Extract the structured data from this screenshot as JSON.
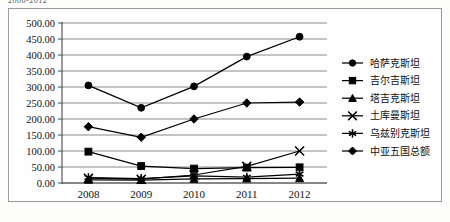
{
  "caption": {
    "text": "2008-2012"
  },
  "chart_data": {
    "type": "line",
    "title": "",
    "subtitle": "",
    "xlabel": "",
    "ylabel": "",
    "categories": [
      "2008",
      "2009",
      "2010",
      "2011",
      "2012"
    ],
    "x": [
      2008,
      2009,
      2010,
      2011,
      2012
    ],
    "ylim": [
      0,
      500
    ],
    "ytick_labels": [
      "0.00",
      "50.00",
      "100.00",
      "150.00",
      "200.00",
      "250.00",
      "300.00",
      "350.00",
      "400.00",
      "450.00",
      "500.00"
    ],
    "ytick_values": [
      0,
      50,
      100,
      150,
      200,
      250,
      300,
      350,
      400,
      450,
      500
    ],
    "ytick_step": 50,
    "grid": "horizontal",
    "legend_position": "right",
    "series": [
      {
        "name": "哈萨克斯坦",
        "marker": "circle",
        "values": [
          305.0,
          235.0,
          302.0,
          395.0,
          457.0
        ]
      },
      {
        "name": "吉尔吉斯坦",
        "marker": "square",
        "values": [
          98.0,
          53.0,
          45.0,
          48.0,
          49.0
        ]
      },
      {
        "name": "塔吉克斯坦",
        "marker": "triangle",
        "values": [
          10.0,
          9.0,
          13.0,
          14.0,
          15.0
        ]
      },
      {
        "name": "土库曼斯坦",
        "marker": "x-cross",
        "values": [
          15.0,
          12.0,
          25.0,
          52.0,
          100.0
        ]
      },
      {
        "name": "乌兹别克斯坦",
        "marker": "asterisk",
        "values": [
          17.0,
          14.0,
          22.0,
          18.0,
          28.0
        ]
      },
      {
        "name": "中亚五国总额",
        "marker": "diamond",
        "values": [
          176.0,
          143.0,
          200.0,
          250.0,
          253.0
        ]
      }
    ],
    "colors": {
      "series": "#000000",
      "gridline": "#7d7d7d",
      "axis": "#4a4a4a",
      "background": "#fefefe",
      "border": "#9a9a9a"
    }
  }
}
